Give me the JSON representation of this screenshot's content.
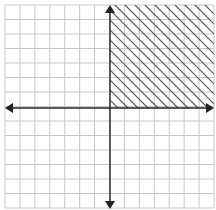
{
  "chart_data": {
    "type": "inequality-graph",
    "title": "",
    "xlabel": "",
    "ylabel": "",
    "grid": true,
    "grid_cells_x": 14,
    "grid_cells_y": 14,
    "xlim": [
      -7,
      7
    ],
    "ylim": [
      -7,
      7
    ],
    "axes_origin": [
      0,
      0
    ],
    "shaded_region": {
      "description": "First quadrant (x >= 0 and y >= 0)",
      "inequalities": [
        "x >= 0",
        "y >= 0"
      ],
      "pattern": "diagonal-hatch",
      "hatch_direction": "down-right"
    },
    "axis_arrows": [
      "left",
      "right",
      "up",
      "down"
    ]
  },
  "colors": {
    "grid": "#c8c8c8",
    "axis": "#222222",
    "hatch": "#555555",
    "background": "#ffffff"
  },
  "layout": {
    "left": 5,
    "top": 5,
    "right": 214,
    "bottom": 208,
    "origin_x": 110,
    "origin_y": 108
  }
}
